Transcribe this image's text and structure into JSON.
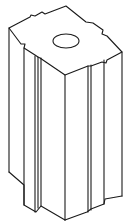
{
  "diagram": {
    "style": "black line art on white",
    "colors": {
      "background": "#ffffff",
      "line": "#1a1a1a"
    },
    "parts": [
      {
        "id": "top-face",
        "label": "top face with corner notches"
      },
      {
        "id": "top-hole",
        "label": "circular through-hole"
      },
      {
        "id": "left-face",
        "label": "left side face with vertical groove"
      },
      {
        "id": "right-face",
        "label": "right side face with vertical groove"
      }
    ]
  }
}
